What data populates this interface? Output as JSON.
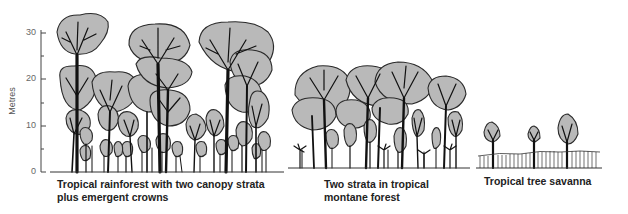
{
  "axis": {
    "label": "Metres",
    "ticks": [
      {
        "value": "30",
        "y": 33
      },
      {
        "value": "20",
        "y": 79
      },
      {
        "value": "10",
        "y": 126
      },
      {
        "value": "0",
        "y": 172
      }
    ]
  },
  "panels": [
    {
      "id": "rainforest",
      "caption_line1": "Tropical rainforest with two canopy strata",
      "caption_line2": "plus emergent crowns"
    },
    {
      "id": "montane",
      "caption_line1": "Two strata in tropical",
      "caption_line2": "montane forest"
    },
    {
      "id": "savanna",
      "caption_line1": "Tropical tree savanna",
      "caption_line2": ""
    }
  ],
  "colors": {
    "crown_fill": "#b9b9b9",
    "outline": "#2a2a2a",
    "text": "#222222"
  }
}
